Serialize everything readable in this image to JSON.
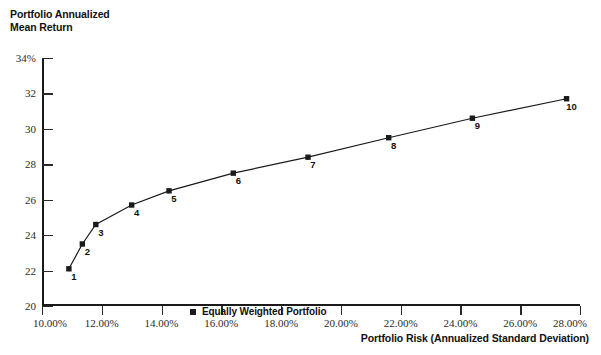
{
  "chart_data": {
    "type": "line",
    "title": "",
    "ylabel": "Portfolio Annualized\nMean Return",
    "xlabel": "Portfolio Risk (Annualized Standard Deviation)",
    "ylim": [
      20,
      34
    ],
    "xlim": [
      10,
      28
    ],
    "grid": false,
    "legend_position": "inside-left",
    "y_ticks": [
      "34%",
      "32",
      "30",
      "28",
      "26",
      "24",
      "22",
      "20"
    ],
    "y_tick_values": [
      34,
      32,
      30,
      28,
      26,
      24,
      22,
      20
    ],
    "x_ticks": [
      "10.00%",
      "12.00%",
      "14.00%",
      "16.00%",
      "18.00%",
      "20.00%",
      "22.00%",
      "24.00%",
      "26.00%",
      "28.00%"
    ],
    "x_tick_values": [
      10,
      12,
      14,
      16,
      18,
      20,
      22,
      24,
      26,
      28
    ],
    "series": [
      {
        "name": "Equally Weighted Portfolio",
        "marker": "square",
        "color": "#1a1a1a",
        "points": [
          {
            "label": "1",
            "x": 10.9,
            "y": 22.1
          },
          {
            "label": "2",
            "x": 11.35,
            "y": 23.5
          },
          {
            "label": "3",
            "x": 11.8,
            "y": 24.6
          },
          {
            "label": "4",
            "x": 13.0,
            "y": 25.7
          },
          {
            "label": "5",
            "x": 14.25,
            "y": 26.5
          },
          {
            "label": "6",
            "x": 16.4,
            "y": 27.5
          },
          {
            "label": "7",
            "x": 18.9,
            "y": 28.4
          },
          {
            "label": "8",
            "x": 21.6,
            "y": 29.5
          },
          {
            "label": "9",
            "x": 24.4,
            "y": 30.6
          },
          {
            "label": "10",
            "x": 27.55,
            "y": 31.7
          }
        ]
      }
    ]
  },
  "legend": {
    "label": "Equally Weighted Portfolio"
  }
}
